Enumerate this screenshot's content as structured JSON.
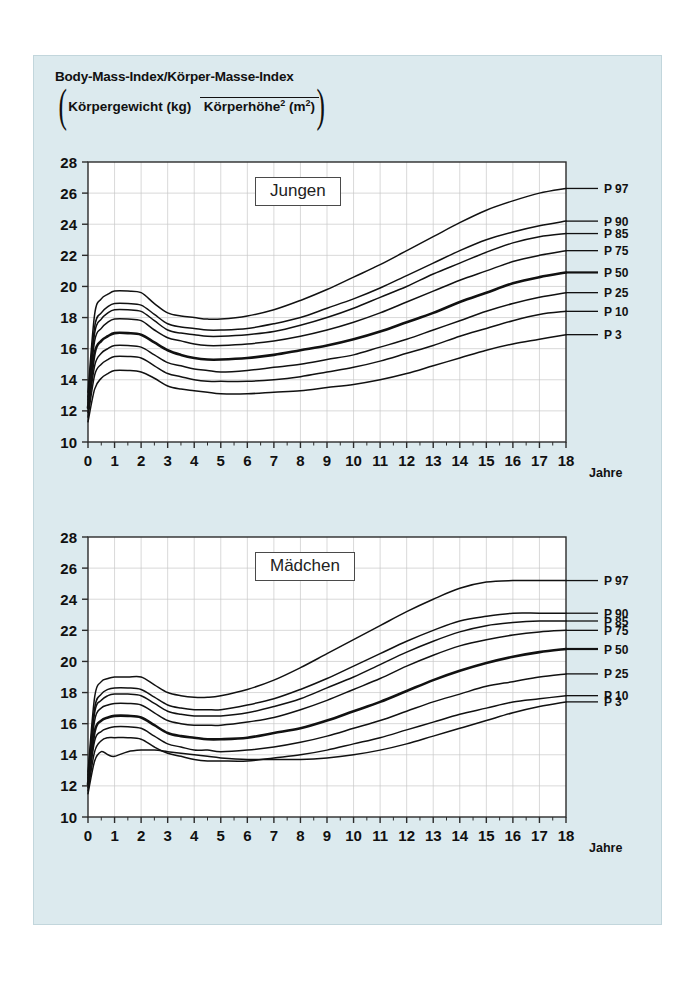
{
  "figure": {
    "title_line": "Body-Mass-Index/Körper-Masse-Index",
    "formula_numerator": "Körpergewicht (kg)",
    "formula_denominator_base": "Körperhöhe",
    "formula_denominator_exp": "2",
    "formula_denominator_unit": " (m",
    "formula_denominator_unit_exp": "2",
    "formula_denominator_unit_close": ")",
    "paren_open": "(",
    "paren_close": ")",
    "background_color": "#dceaee",
    "plot_background_color": "#ffffff",
    "curve_color": "#111111",
    "grid_color": "#c9c9c9"
  },
  "chart_data": [
    {
      "type": "line",
      "title": "Jungen",
      "xlabel": "Jahre",
      "ylabel": "",
      "xlim": [
        0,
        18
      ],
      "ylim": [
        10,
        28
      ],
      "xticks": [
        "0",
        "1",
        "2",
        "3",
        "4",
        "5",
        "6",
        "7",
        "8",
        "9",
        "10",
        "11",
        "12",
        "13",
        "14",
        "15",
        "16",
        "17",
        "18"
      ],
      "yticks": [
        "10",
        "12",
        "14",
        "16",
        "18",
        "20",
        "22",
        "24",
        "26",
        "28"
      ],
      "grid": true,
      "legend_position": "right-of-axes",
      "x": [
        0,
        0.25,
        0.5,
        0.75,
        1,
        1.5,
        2,
        2.5,
        3,
        3.5,
        4,
        4.5,
        5,
        6,
        7,
        8,
        9,
        10,
        11,
        12,
        13,
        14,
        15,
        16,
        17,
        18
      ],
      "series": [
        {
          "name": "P 97",
          "label": "P 97",
          "emphasis": false,
          "values": [
            13.2,
            18.2,
            19.2,
            19.5,
            19.7,
            19.7,
            19.6,
            18.9,
            18.3,
            18.1,
            18.0,
            17.9,
            17.9,
            18.1,
            18.5,
            19.1,
            19.8,
            20.6,
            21.4,
            22.3,
            23.2,
            24.1,
            24.9,
            25.5,
            26.0,
            26.3
          ]
        },
        {
          "name": "P 90",
          "label": "P 90",
          "emphasis": false,
          "values": [
            12.9,
            17.4,
            18.3,
            18.7,
            18.9,
            18.9,
            18.8,
            18.2,
            17.6,
            17.4,
            17.3,
            17.2,
            17.2,
            17.3,
            17.6,
            18.0,
            18.6,
            19.2,
            19.9,
            20.7,
            21.5,
            22.3,
            23.0,
            23.5,
            23.9,
            24.2
          ]
        },
        {
          "name": "P 85",
          "label": "P 85",
          "emphasis": false,
          "values": [
            12.7,
            17.0,
            17.9,
            18.3,
            18.5,
            18.5,
            18.4,
            17.8,
            17.2,
            17.0,
            16.9,
            16.8,
            16.8,
            16.9,
            17.1,
            17.5,
            18.0,
            18.6,
            19.3,
            20.0,
            20.8,
            21.5,
            22.2,
            22.8,
            23.2,
            23.4
          ]
        },
        {
          "name": "P 75",
          "label": "P 75",
          "emphasis": false,
          "values": [
            12.5,
            16.5,
            17.3,
            17.7,
            17.9,
            17.9,
            17.8,
            17.2,
            16.7,
            16.5,
            16.3,
            16.2,
            16.2,
            16.3,
            16.5,
            16.8,
            17.2,
            17.7,
            18.3,
            19.0,
            19.7,
            20.4,
            21.0,
            21.6,
            22.0,
            22.3
          ]
        },
        {
          "name": "P 50",
          "label": "P 50",
          "emphasis": true,
          "values": [
            12.2,
            15.7,
            16.5,
            16.8,
            17.0,
            17.0,
            16.9,
            16.4,
            15.9,
            15.6,
            15.4,
            15.3,
            15.3,
            15.4,
            15.6,
            15.9,
            16.2,
            16.6,
            17.1,
            17.7,
            18.3,
            19.0,
            19.6,
            20.2,
            20.6,
            20.9
          ]
        },
        {
          "name": "P 25",
          "label": "P 25",
          "emphasis": false,
          "values": [
            11.9,
            14.9,
            15.7,
            16.0,
            16.2,
            16.2,
            16.1,
            15.6,
            15.1,
            14.9,
            14.7,
            14.6,
            14.5,
            14.6,
            14.8,
            15.0,
            15.3,
            15.6,
            16.1,
            16.6,
            17.2,
            17.8,
            18.4,
            18.9,
            19.3,
            19.6
          ]
        },
        {
          "name": "P 10",
          "label": "P 10",
          "emphasis": false,
          "values": [
            11.6,
            14.3,
            15.0,
            15.3,
            15.5,
            15.5,
            15.4,
            14.9,
            14.4,
            14.2,
            14.0,
            13.9,
            13.9,
            13.9,
            14.0,
            14.2,
            14.5,
            14.8,
            15.2,
            15.7,
            16.2,
            16.8,
            17.3,
            17.8,
            18.2,
            18.4
          ]
        },
        {
          "name": "P 3",
          "label": "P 3",
          "emphasis": false,
          "values": [
            11.3,
            13.4,
            14.1,
            14.4,
            14.6,
            14.6,
            14.5,
            14.1,
            13.6,
            13.4,
            13.3,
            13.2,
            13.1,
            13.1,
            13.2,
            13.3,
            13.5,
            13.7,
            14.0,
            14.4,
            14.9,
            15.4,
            15.9,
            16.3,
            16.6,
            16.9
          ]
        }
      ]
    },
    {
      "type": "line",
      "title": "Mädchen",
      "xlabel": "Jahre",
      "ylabel": "",
      "xlim": [
        0,
        18
      ],
      "ylim": [
        10,
        28
      ],
      "xticks": [
        "0",
        "1",
        "2",
        "3",
        "4",
        "5",
        "6",
        "7",
        "8",
        "9",
        "10",
        "11",
        "12",
        "13",
        "14",
        "15",
        "16",
        "17",
        "18"
      ],
      "yticks": [
        "10",
        "12",
        "14",
        "16",
        "18",
        "20",
        "22",
        "24",
        "26",
        "28"
      ],
      "grid": true,
      "legend_position": "right-of-axes",
      "x": [
        0,
        0.25,
        0.5,
        0.75,
        1,
        1.5,
        2,
        2.5,
        3,
        3.5,
        4,
        4.5,
        5,
        6,
        7,
        8,
        9,
        10,
        11,
        12,
        13,
        14,
        15,
        16,
        17,
        18
      ],
      "series": [
        {
          "name": "P 97",
          "label": "P 97",
          "emphasis": false,
          "values": [
            12.9,
            17.7,
            18.7,
            18.9,
            19.0,
            19.0,
            19.0,
            18.5,
            18.0,
            17.8,
            17.7,
            17.7,
            17.8,
            18.2,
            18.8,
            19.6,
            20.5,
            21.4,
            22.3,
            23.2,
            24.0,
            24.7,
            25.1,
            25.2,
            25.2,
            25.2
          ]
        },
        {
          "name": "P 90",
          "label": "P 90",
          "emphasis": false,
          "values": [
            12.7,
            17.0,
            17.9,
            18.2,
            18.3,
            18.3,
            18.2,
            17.7,
            17.2,
            17.0,
            16.9,
            16.9,
            16.9,
            17.2,
            17.6,
            18.2,
            18.9,
            19.7,
            20.5,
            21.3,
            22.0,
            22.6,
            22.9,
            23.1,
            23.1,
            23.1
          ]
        },
        {
          "name": "P 85",
          "label": "P 85",
          "emphasis": false,
          "values": [
            12.5,
            16.7,
            17.5,
            17.8,
            17.9,
            17.9,
            17.8,
            17.3,
            16.8,
            16.6,
            16.5,
            16.5,
            16.5,
            16.7,
            17.1,
            17.6,
            18.3,
            19.0,
            19.8,
            20.6,
            21.3,
            21.9,
            22.3,
            22.5,
            22.6,
            22.6
          ]
        },
        {
          "name": "P 75",
          "label": "P 75",
          "emphasis": false,
          "values": [
            12.4,
            16.2,
            17.0,
            17.2,
            17.3,
            17.3,
            17.2,
            16.7,
            16.2,
            16.0,
            15.9,
            15.9,
            15.9,
            16.1,
            16.4,
            16.9,
            17.5,
            18.2,
            18.9,
            19.7,
            20.4,
            21.0,
            21.4,
            21.7,
            21.9,
            22.0
          ]
        },
        {
          "name": "P 50",
          "label": "P 50",
          "emphasis": true,
          "values": [
            12.1,
            15.5,
            16.2,
            16.4,
            16.5,
            16.5,
            16.4,
            15.9,
            15.4,
            15.2,
            15.1,
            15.0,
            15.0,
            15.1,
            15.4,
            15.7,
            16.2,
            16.8,
            17.4,
            18.1,
            18.8,
            19.4,
            19.9,
            20.3,
            20.6,
            20.8
          ]
        },
        {
          "name": "P 25",
          "label": "P 25",
          "emphasis": false,
          "values": [
            11.9,
            14.9,
            15.5,
            15.7,
            15.8,
            15.8,
            15.7,
            15.2,
            14.7,
            14.5,
            14.3,
            14.3,
            14.2,
            14.3,
            14.5,
            14.8,
            15.2,
            15.7,
            16.2,
            16.8,
            17.4,
            17.9,
            18.4,
            18.7,
            19.0,
            19.2
          ]
        },
        {
          "name": "P 10",
          "label": "P 10",
          "emphasis": false,
          "values": [
            11.7,
            14.2,
            14.9,
            15.1,
            15.1,
            15.1,
            15.0,
            14.5,
            14.1,
            13.9,
            13.7,
            13.6,
            13.6,
            13.6,
            13.8,
            14.0,
            14.3,
            14.7,
            15.1,
            15.6,
            16.1,
            16.6,
            17.0,
            17.4,
            17.6,
            17.8
          ]
        },
        {
          "name": "P 3",
          "label": "P 3",
          "emphasis": false,
          "values": [
            11.5,
            13.6,
            14.2,
            14.0,
            13.9,
            14.2,
            14.3,
            14.3,
            14.2,
            14.1,
            14.0,
            13.9,
            13.8,
            13.7,
            13.7,
            13.7,
            13.8,
            14.0,
            14.3,
            14.7,
            15.2,
            15.7,
            16.2,
            16.7,
            17.1,
            17.4
          ]
        }
      ]
    }
  ]
}
